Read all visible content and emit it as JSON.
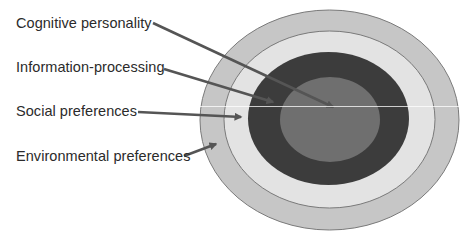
{
  "diagram": {
    "type": "concentric-layers",
    "labels": [
      {
        "id": "cognitive-personality",
        "text": "Cognitive personality",
        "top": 16
      },
      {
        "id": "information-processing",
        "text": "Information-processing",
        "top": 60
      },
      {
        "id": "social-preferences",
        "text": "Social preferences",
        "top": 104
      },
      {
        "id": "environmental-preferences",
        "text": "Environmental preferences",
        "top": 149
      }
    ],
    "layers": [
      {
        "name": "Environmental preferences",
        "color": "#c6c6c6",
        "cx": 329.5,
        "cy": 120,
        "rx": 129.5,
        "ry": 110
      },
      {
        "name": "Social preferences",
        "color": "#e3e3e3",
        "cx": 329.5,
        "cy": 119.5,
        "rx": 105.5,
        "ry": 88.5
      },
      {
        "name": "Information-processing",
        "color": "#3c3c3c",
        "cx": 328.5,
        "cy": 118.5,
        "rx": 80.5,
        "ry": 66.5
      },
      {
        "name": "Cognitive personality",
        "color": "#6f6f6f",
        "cx": 330,
        "cy": 119.5,
        "rx": 50,
        "ry": 42.5
      }
    ],
    "outline_color": "#7a7a7a",
    "arrow_color": "#555555",
    "arrows": [
      {
        "from": "Cognitive personality",
        "x1": 153,
        "y1": 23,
        "x2": 333,
        "y2": 107
      },
      {
        "from": "Information-processing",
        "x1": 164,
        "y1": 69,
        "x2": 273,
        "y2": 102
      },
      {
        "from": "Social preferences",
        "x1": 138,
        "y1": 112,
        "x2": 241,
        "y2": 117
      },
      {
        "from": "Environmental preferences",
        "x1": 184,
        "y1": 156,
        "x2": 216,
        "y2": 144
      }
    ]
  }
}
